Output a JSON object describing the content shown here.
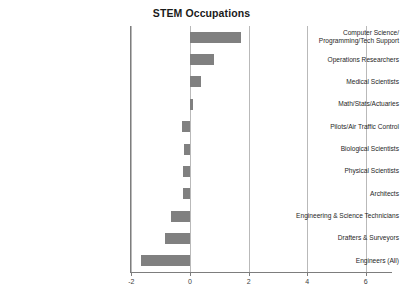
{
  "chart": {
    "title": "STEM Occupations"
  },
  "chart_data": {
    "type": "bar",
    "orientation": "horizontal",
    "title": "STEM Occupations",
    "xlabel": "",
    "ylabel": "",
    "xlim": [
      -2.8,
      6.8
    ],
    "xticks": [
      -2,
      0,
      2,
      4,
      6
    ],
    "xtick_labels": [
      "-2",
      "0",
      "2",
      "4",
      "6"
    ],
    "grid": true,
    "grid_axis": "x",
    "legend": false,
    "bar_color": "#808080",
    "categories": [
      "Computer Science/\nProgramming/Tech Support",
      "Operations Researchers",
      "Medical Scientists",
      "Math/Stats/Actuaries",
      "Pilots/Air Traffic Control",
      "Biological Scientists",
      "Physical Scientists",
      "Architects",
      "Engineering & Science Technicians",
      "Drafters & Surveyors",
      "Engineers (All)"
    ],
    "category_labels": [
      [
        "Computer Science/",
        "Programming/Tech Support"
      ],
      [
        "Operations Researchers"
      ],
      [
        "Medical Scientists"
      ],
      [
        "Math/Stats/Actuaries"
      ],
      [
        "Pilots/Air Traffic Control"
      ],
      [
        "Biological Scientists"
      ],
      [
        "Physical Scientists"
      ],
      [
        "Architects"
      ],
      [
        "Engineering & Science Technicians"
      ],
      [
        "Drafters & Surveyors"
      ],
      [
        "Engineers (All)"
      ]
    ],
    "values": [
      1.75,
      0.82,
      0.38,
      0.1,
      -0.28,
      -0.2,
      -0.23,
      -0.25,
      -0.65,
      -0.87,
      -1.68
    ]
  }
}
